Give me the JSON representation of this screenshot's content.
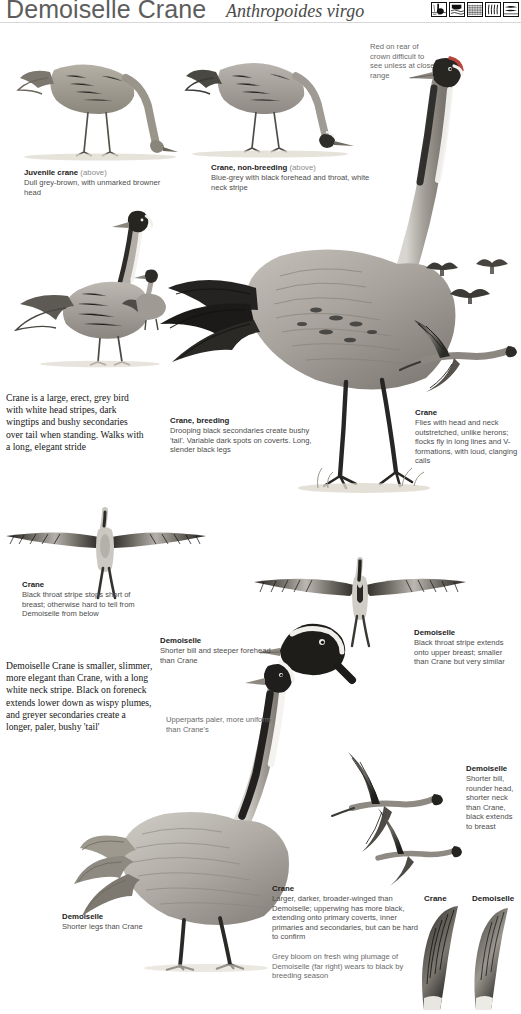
{
  "header": {
    "title": "Demoiselle Crane",
    "scientific_name": "Anthropoides virgo",
    "icons": [
      {
        "name": "habitat-icon-wetland"
      },
      {
        "name": "habitat-icon-water"
      },
      {
        "name": "habitat-icon-farmland"
      },
      {
        "name": "habitat-icon-grassland"
      },
      {
        "name": "habitat-icon-flight"
      }
    ]
  },
  "captions": {
    "juvenile_crane": {
      "title": "Juvenile crane",
      "title_note": "(above)",
      "text": "Dull grey-brown, with unmarked browner head"
    },
    "crane_nonbreeding": {
      "title": "Crane, non-breeding",
      "title_note": "(above)",
      "text": "Blue-grey with black forehead and throat, white neck stripe"
    },
    "red_crown_note": {
      "text": "Red on rear of crown difficult to see unless at close range"
    },
    "crane_breeding": {
      "title": "Crane, breeding",
      "text": "Drooping black secondaries create bushy 'tail'. Variable dark spots on coverts. Long, slender black legs"
    },
    "crane_flight": {
      "title": "Crane",
      "text": "Flies with head and neck outstretched, unlike herons; flocks fly in long lines and V-formations, with loud, clanging calls"
    },
    "crane_below": {
      "title": "Crane",
      "text": "Black throat stripe stops short of breast; otherwise hard to tell from Demoiselle from below"
    },
    "demoiselle_head": {
      "title": "Demoiselle",
      "text": "Shorter bill and steeper forehead than Crane"
    },
    "demoiselle_below": {
      "title": "Demoiselle",
      "text": "Black throat stripe extends onto upper breast; smaller than Crane but very similar"
    },
    "upperparts_note": {
      "text": "Upperparts paler, more uniform than Crane's"
    },
    "demoiselle_legs": {
      "title": "Demoiselle",
      "text": "Shorter legs than Crane"
    },
    "demoiselle_bill": {
      "title": "Demoiselle",
      "text": "Shorter bill, rounder head, shorter neck than Crane, black extends to breast"
    },
    "crane_upperwing": {
      "title": "Crane",
      "text": "Larger, darker, broader-winged than Demoiselle; upperwing has more black, extending onto primary coverts, inner primaries and secondaries, but can be hard to confirm"
    },
    "grey_bloom_note": {
      "text": "Grey bloom on fresh wing plumage of Demoiselle (far right) wears to black by breeding season"
    }
  },
  "wing_labels": {
    "crane": "Crane",
    "demoiselle": "Demoiselle"
  },
  "body_text": {
    "crane": "Crane is a large, erect, grey bird with white head stripes, dark wingtips and bushy secondaries over tail when standing. Walks with a long, elegant stride",
    "demoiselle": "Demoiselle Crane is smaller, slimmer, more elegant than Crane, with a long white neck stripe. Black on foreneck extends lower down as wispy plumes, and greyer secondaries create a longer, paler, bushy 'tail'"
  },
  "colors": {
    "text_dark": "#1b1b1b",
    "text_grey": "#4c4c4c",
    "text_light": "#8a8a8a",
    "title": "#5d5d5d",
    "plumage_grey": "#9a9a96",
    "plumage_dark": "#3a3a38",
    "plumage_black": "#1c1c1c",
    "ground": "#ded9cf"
  }
}
